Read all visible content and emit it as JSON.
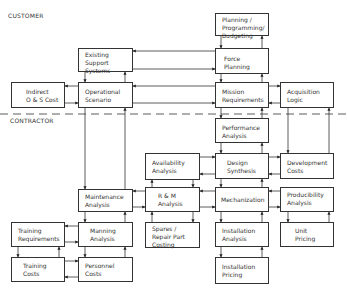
{
  "regions": {
    "customer_label": "CUSTOMER",
    "contractor_label": "CONTRACTOR"
  },
  "boxes": {
    "planning": "Planning /\nProgramming/\nBudgeting",
    "existing_support": "Existing\nSupport Systems",
    "force_planning": "Force\nPlanning",
    "indirect_cost": "Indirect\nO & S Cost",
    "operational_scenario": "Operational\nScenario",
    "mission_requirements": "Mission\nRequirements",
    "acquisition_logic": "Acquisition\nLogic",
    "performance_analysis": "Performance\nAnalysis",
    "availability_analysis": "Availability\nAnalysis",
    "design_synthesis": "Design\nSynthesis",
    "development_costs": "Development\nCosts",
    "maintenance_analysis": "Maintenance\nAnalysis",
    "rm_analysis": "R & M\nAnalysis",
    "mechanization": "Mechanization",
    "producibility_analysis": "Producibility\nAnalysis",
    "training_requirements": "Training\nRequirements",
    "manning_analysis": "Manning\nAnalysis",
    "spares_costing": "Spares /\nRepair Part\nCosting",
    "installation_analysis": "Installation\nAnalysis",
    "unit_pricing": "Unit\nPricing",
    "training_costs": "Training\nCosts",
    "personnel_costs": "Personnel\nCosts",
    "installation_pricing": "Installation\nPricing"
  }
}
